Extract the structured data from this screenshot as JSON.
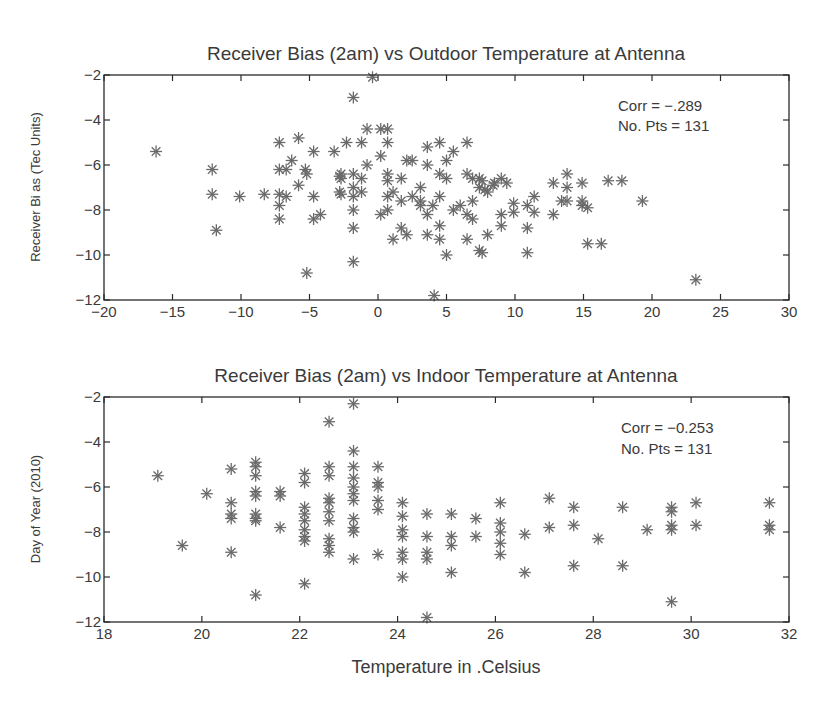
{
  "chart_data": [
    {
      "type": "scatter",
      "title": "Receiver Bias (2am) vs Outdoor Temperature at Antenna",
      "xlabel": "",
      "ylabel": "Receiver Bi as (Tec Units)",
      "xlim": [
        -20,
        30
      ],
      "ylim": [
        -12,
        -2
      ],
      "xticks": [
        -20,
        -15,
        -10,
        -5,
        0,
        5,
        10,
        15,
        20,
        25,
        30
      ],
      "yticks": [
        -12,
        -10,
        -8,
        -6,
        -4,
        -2
      ],
      "marker": "asterisk",
      "grid": false,
      "annotation": [
        "Corr = −.289",
        "No. Pts = 131"
      ],
      "points": [
        [
          -16.2,
          -5.4
        ],
        [
          -12.1,
          -6.2
        ],
        [
          -12.1,
          -7.3
        ],
        [
          -11.8,
          -8.9
        ],
        [
          -10.1,
          -7.4
        ],
        [
          -8.3,
          -7.3
        ],
        [
          -7.2,
          -5.0
        ],
        [
          -7.2,
          -6.2
        ],
        [
          -7.2,
          -7.3
        ],
        [
          -7.2,
          -7.8
        ],
        [
          -7.2,
          -8.4
        ],
        [
          -6.7,
          -6.2
        ],
        [
          -6.7,
          -7.4
        ],
        [
          -6.3,
          -5.8
        ],
        [
          -5.8,
          -4.8
        ],
        [
          -5.8,
          -6.9
        ],
        [
          -5.3,
          -6.2
        ],
        [
          -5.2,
          -6.4
        ],
        [
          -5.2,
          -10.8
        ],
        [
          -4.7,
          -5.4
        ],
        [
          -4.7,
          -7.4
        ],
        [
          -4.7,
          -8.4
        ],
        [
          -4.2,
          -8.2
        ],
        [
          -3.2,
          -5.4
        ],
        [
          -2.7,
          -6.4
        ],
        [
          -2.7,
          -6.6
        ],
        [
          -2.7,
          -7.3
        ],
        [
          -2.3,
          -5.0
        ],
        [
          -0.4,
          -2.1
        ],
        [
          -1.8,
          -3.0
        ],
        [
          -1.2,
          -5.0
        ],
        [
          -0.8,
          -4.4
        ],
        [
          0.2,
          -4.4
        ],
        [
          0.7,
          -4.4
        ],
        [
          0.7,
          -5.0
        ],
        [
          0.2,
          -5.6
        ],
        [
          -0.8,
          -6.0
        ],
        [
          -2.8,
          -6.5
        ],
        [
          -2.8,
          -7.2
        ],
        [
          -1.8,
          -6.4
        ],
        [
          -1.2,
          -6.6
        ],
        [
          -1.8,
          -7.0
        ],
        [
          -1.2,
          -7.2
        ],
        [
          -1.8,
          -7.4
        ],
        [
          -1.8,
          -8.0
        ],
        [
          -1.8,
          -8.8
        ],
        [
          -1.8,
          -10.3
        ],
        [
          0.7,
          -6.4
        ],
        [
          0.7,
          -6.7
        ],
        [
          1.7,
          -6.6
        ],
        [
          2.1,
          -5.8
        ],
        [
          2.5,
          -5.8
        ],
        [
          3.6,
          -5.2
        ],
        [
          3.6,
          -6.0
        ],
        [
          4.5,
          -5.0
        ],
        [
          5.5,
          -5.4
        ],
        [
          5.0,
          -5.8
        ],
        [
          6.5,
          -5.0
        ],
        [
          4.5,
          -6.4
        ],
        [
          5.0,
          -6.6
        ],
        [
          3.1,
          -7.0
        ],
        [
          1.1,
          -7.2
        ],
        [
          0.7,
          -7.4
        ],
        [
          1.7,
          -7.6
        ],
        [
          2.5,
          -7.4
        ],
        [
          3.1,
          -7.6
        ],
        [
          3.1,
          -7.8
        ],
        [
          3.6,
          -8.2
        ],
        [
          4.0,
          -7.8
        ],
        [
          4.5,
          -7.4
        ],
        [
          0.7,
          -8.0
        ],
        [
          0.2,
          -8.2
        ],
        [
          1.7,
          -8.8
        ],
        [
          1.1,
          -9.3
        ],
        [
          2.1,
          -9.1
        ],
        [
          3.6,
          -9.1
        ],
        [
          4.5,
          -8.7
        ],
        [
          4.5,
          -9.3
        ],
        [
          5.0,
          -10.0
        ],
        [
          4.1,
          -11.8
        ],
        [
          6.5,
          -6.4
        ],
        [
          6.9,
          -6.6
        ],
        [
          7.4,
          -6.6
        ],
        [
          7.4,
          -7.0
        ],
        [
          8.0,
          -7.2
        ],
        [
          8.4,
          -6.9
        ],
        [
          5.5,
          -8.0
        ],
        [
          6.0,
          -7.8
        ],
        [
          6.5,
          -8.2
        ],
        [
          6.9,
          -7.6
        ],
        [
          6.9,
          -8.4
        ],
        [
          6.5,
          -9.3
        ],
        [
          8.0,
          -9.1
        ],
        [
          7.4,
          -9.8
        ],
        [
          7.6,
          -6.7
        ],
        [
          7.8,
          -7.1
        ],
        [
          8.5,
          -6.8
        ],
        [
          9.0,
          -6.6
        ],
        [
          9.4,
          -6.8
        ],
        [
          9.9,
          -7.7
        ],
        [
          9.9,
          -8.1
        ],
        [
          9.0,
          -8.2
        ],
        [
          9.0,
          -8.7
        ],
        [
          7.6,
          -9.9
        ],
        [
          10.9,
          -8.8
        ],
        [
          10.9,
          -9.9
        ],
        [
          10.9,
          -7.8
        ],
        [
          11.4,
          -7.4
        ],
        [
          11.4,
          -8.1
        ],
        [
          12.8,
          -6.8
        ],
        [
          12.8,
          -8.2
        ],
        [
          13.4,
          -7.6
        ],
        [
          13.8,
          -6.4
        ],
        [
          13.8,
          -7.0
        ],
        [
          13.8,
          -7.6
        ],
        [
          14.9,
          -6.8
        ],
        [
          14.9,
          -7.6
        ],
        [
          14.9,
          -7.8
        ],
        [
          15.3,
          -7.9
        ],
        [
          15.3,
          -9.5
        ],
        [
          16.3,
          -9.5
        ],
        [
          16.8,
          -6.7
        ],
        [
          17.8,
          -6.7
        ],
        [
          19.3,
          -7.6
        ],
        [
          23.2,
          -11.1
        ]
      ]
    },
    {
      "type": "scatter",
      "title": "Receiver Bias (2am) vs Indoor Temperature at Antenna",
      "xlabel": "Temperature in .Celsius",
      "ylabel": "Day of Year (2010)",
      "xlim": [
        18,
        32
      ],
      "ylim": [
        -12,
        -2
      ],
      "xticks": [
        18,
        20,
        22,
        24,
        26,
        28,
        30,
        32
      ],
      "yticks": [
        -12,
        -10,
        -8,
        -6,
        -4,
        -2
      ],
      "marker": "asterisk",
      "grid": false,
      "annotation": [
        "Corr = −0.253",
        "No. Pts = 131"
      ],
      "points": [
        [
          19.1,
          -5.5
        ],
        [
          19.6,
          -8.6
        ],
        [
          20.1,
          -6.3
        ],
        [
          20.6,
          -5.2
        ],
        [
          20.6,
          -6.7
        ],
        [
          20.6,
          -7.2
        ],
        [
          20.6,
          -7.4
        ],
        [
          20.6,
          -8.9
        ],
        [
          21.1,
          -4.9
        ],
        [
          21.1,
          -5.1
        ],
        [
          21.1,
          -5.5
        ],
        [
          21.1,
          -6.2
        ],
        [
          21.1,
          -6.4
        ],
        [
          21.1,
          -7.2
        ],
        [
          21.1,
          -7.4
        ],
        [
          21.1,
          -7.5
        ],
        [
          21.1,
          -10.8
        ],
        [
          21.6,
          -6.2
        ],
        [
          21.6,
          -6.4
        ],
        [
          21.6,
          -7.8
        ],
        [
          22.1,
          -5.4
        ],
        [
          22.1,
          -5.8
        ],
        [
          22.1,
          -6.9
        ],
        [
          22.1,
          -7.2
        ],
        [
          22.1,
          -7.5
        ],
        [
          22.1,
          -7.9
        ],
        [
          22.1,
          -8.2
        ],
        [
          22.1,
          -8.4
        ],
        [
          22.1,
          -10.3
        ],
        [
          22.6,
          -3.1
        ],
        [
          22.6,
          -5.1
        ],
        [
          22.6,
          -5.5
        ],
        [
          22.6,
          -6.5
        ],
        [
          22.6,
          -6.7
        ],
        [
          22.6,
          -7.1
        ],
        [
          22.6,
          -7.5
        ],
        [
          22.6,
          -8.3
        ],
        [
          22.6,
          -8.6
        ],
        [
          22.6,
          -8.9
        ],
        [
          23.1,
          -2.3
        ],
        [
          23.1,
          -4.4
        ],
        [
          23.1,
          -5.1
        ],
        [
          23.1,
          -5.6
        ],
        [
          23.1,
          -6.0
        ],
        [
          23.1,
          -6.3
        ],
        [
          23.1,
          -6.6
        ],
        [
          23.1,
          -7.4
        ],
        [
          23.1,
          -7.8
        ],
        [
          23.1,
          -8.0
        ],
        [
          23.1,
          -9.2
        ],
        [
          23.6,
          -5.1
        ],
        [
          23.6,
          -5.8
        ],
        [
          23.6,
          -6.0
        ],
        [
          23.6,
          -6.6
        ],
        [
          23.6,
          -7.0
        ],
        [
          23.6,
          -9.0
        ],
        [
          24.1,
          -6.7
        ],
        [
          24.1,
          -7.3
        ],
        [
          24.1,
          -7.9
        ],
        [
          24.1,
          -8.2
        ],
        [
          24.1,
          -8.9
        ],
        [
          24.1,
          -9.2
        ],
        [
          24.1,
          -10.0
        ],
        [
          24.6,
          -7.2
        ],
        [
          24.6,
          -8.2
        ],
        [
          24.6,
          -8.9
        ],
        [
          24.6,
          -9.2
        ],
        [
          24.6,
          -11.8
        ],
        [
          25.1,
          -7.2
        ],
        [
          25.1,
          -8.2
        ],
        [
          25.1,
          -8.6
        ],
        [
          25.1,
          -9.8
        ],
        [
          25.6,
          -7.4
        ],
        [
          25.6,
          -8.2
        ],
        [
          26.1,
          -6.7
        ],
        [
          26.1,
          -7.6
        ],
        [
          26.1,
          -8.0
        ],
        [
          26.1,
          -8.5
        ],
        [
          26.1,
          -9.0
        ],
        [
          26.6,
          -8.1
        ],
        [
          26.6,
          -9.8
        ],
        [
          27.1,
          -6.5
        ],
        [
          27.1,
          -7.8
        ],
        [
          27.6,
          -6.9
        ],
        [
          27.6,
          -7.7
        ],
        [
          27.6,
          -9.5
        ],
        [
          28.1,
          -8.3
        ],
        [
          28.6,
          -6.9
        ],
        [
          28.6,
          -9.5
        ],
        [
          29.1,
          -7.9
        ],
        [
          29.6,
          -6.9
        ],
        [
          29.6,
          -7.1
        ],
        [
          29.6,
          -7.7
        ],
        [
          29.6,
          -7.9
        ],
        [
          29.6,
          -11.1
        ],
        [
          30.1,
          -6.7
        ],
        [
          30.1,
          -7.7
        ],
        [
          31.6,
          -6.7
        ],
        [
          31.6,
          -7.7
        ],
        [
          31.6,
          -7.9
        ]
      ]
    }
  ]
}
